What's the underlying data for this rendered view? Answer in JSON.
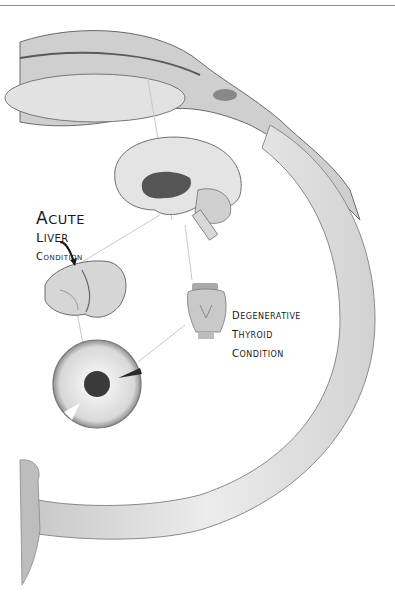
{
  "figure": {
    "colors": {
      "background": "#ffffff",
      "ink": "#1a1a1a",
      "tissue_light": "#e6e6e6",
      "tissue_mid": "#b8b8b8",
      "tissue_dark": "#555555",
      "connector_line": "#c8c8c8"
    },
    "parts": [
      "optic-band",
      "brain",
      "liver",
      "thyroid",
      "iris"
    ],
    "labels": {
      "liver": {
        "line1_cap": "A",
        "line1_rest": "CUTE",
        "line2_cap": "L",
        "line2_rest": "IVER",
        "line3_cap": "C",
        "line3_rest": "ONDITION"
      },
      "thyroid": {
        "line1_cap": "D",
        "line1_rest": "EGENERATIVE",
        "line2_cap": "T",
        "line2_rest": "HYROID",
        "line3_cap": "C",
        "line3_rest": "ONDITION"
      }
    }
  }
}
